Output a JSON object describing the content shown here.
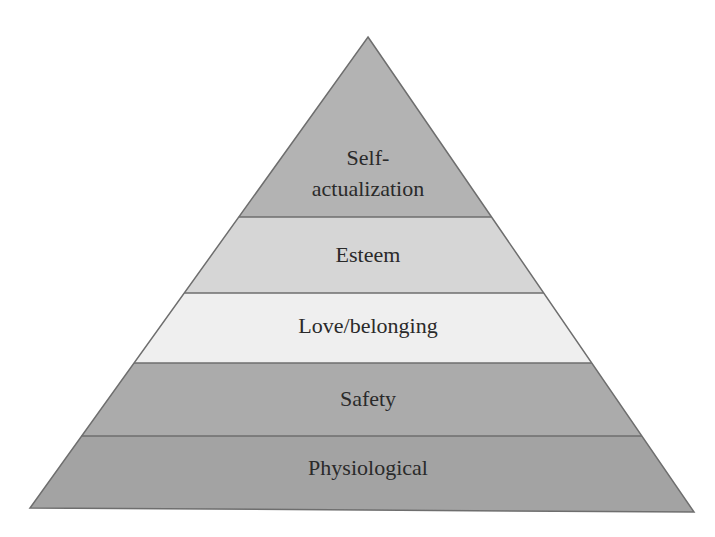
{
  "diagram": {
    "type": "pyramid",
    "geometry": {
      "apex": [
        368,
        37
      ],
      "base_left": [
        30,
        508
      ],
      "base_right": [
        694,
        512
      ],
      "boundaries_y": [
        217,
        293,
        363,
        436
      ]
    },
    "outline_color": "#6e6e6e",
    "layers": [
      {
        "label_lines": [
          "Self-",
          "actualization"
        ],
        "fill": "#b3b3b3",
        "label_y": [
          165,
          196
        ]
      },
      {
        "label_lines": [
          "Esteem"
        ],
        "fill": "#d6d6d6",
        "label_y": [
          262
        ]
      },
      {
        "label_lines": [
          "Love/belonging"
        ],
        "fill": "#efefef",
        "label_y": [
          333
        ]
      },
      {
        "label_lines": [
          "Safety"
        ],
        "fill": "#ababab",
        "label_y": [
          406
        ]
      },
      {
        "label_lines": [
          "Physiological"
        ],
        "fill": "#a3a3a3",
        "label_y": [
          475
        ]
      }
    ]
  },
  "labels": {
    "self_1": "Self-",
    "self_2": "actualization",
    "esteem": "Esteem",
    "love": "Love/belonging",
    "safety": "Safety",
    "physiological": "Physiological"
  }
}
